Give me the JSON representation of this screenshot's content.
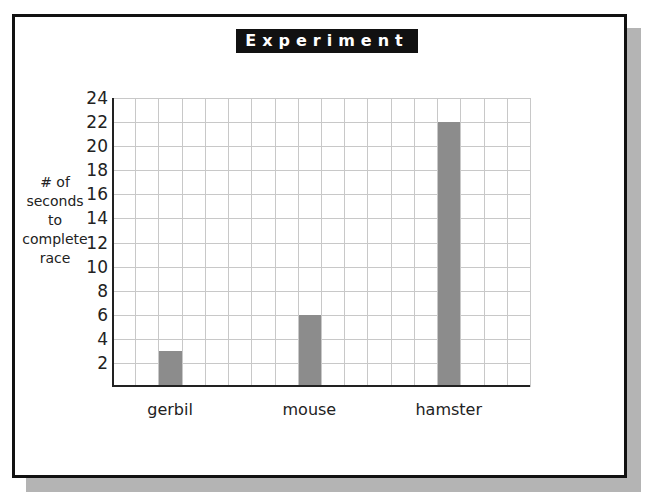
{
  "title": "Experiment 7",
  "chart_data": {
    "type": "bar",
    "title": "Experiment 7",
    "categories": [
      "gerbil",
      "mouse",
      "hamster"
    ],
    "values": [
      3,
      6,
      22
    ],
    "xlabel": "",
    "ylabel": "# of seconds to complete race",
    "ylabel_lines": [
      "# of",
      "seconds",
      "to",
      "complete",
      "race"
    ],
    "ylim": [
      0,
      24
    ],
    "yticks": [
      "2",
      "4",
      "6",
      "8",
      "10",
      "12",
      "14",
      "16",
      "18",
      "20",
      "22",
      "24"
    ],
    "grid": true,
    "grid_columns": 18,
    "legend": null,
    "colors": {
      "bar": "#8c8c8c",
      "grid": "#c8c8c8",
      "frame": "#111111",
      "shadow": "#b4b4b4"
    }
  }
}
